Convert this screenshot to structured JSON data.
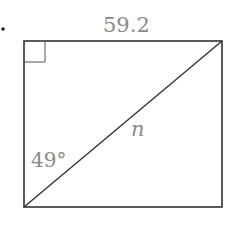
{
  "diagram": {
    "type": "rectangle-with-diagonal",
    "bullet": "•",
    "labels": {
      "top_side": "59.2",
      "diagonal": "n",
      "angle": "49°"
    },
    "marks": {
      "right_angle": "top-left corner"
    },
    "colors": {
      "stroke": "#333333",
      "label": "#8a8a8a",
      "background": "#ffffff"
    }
  }
}
